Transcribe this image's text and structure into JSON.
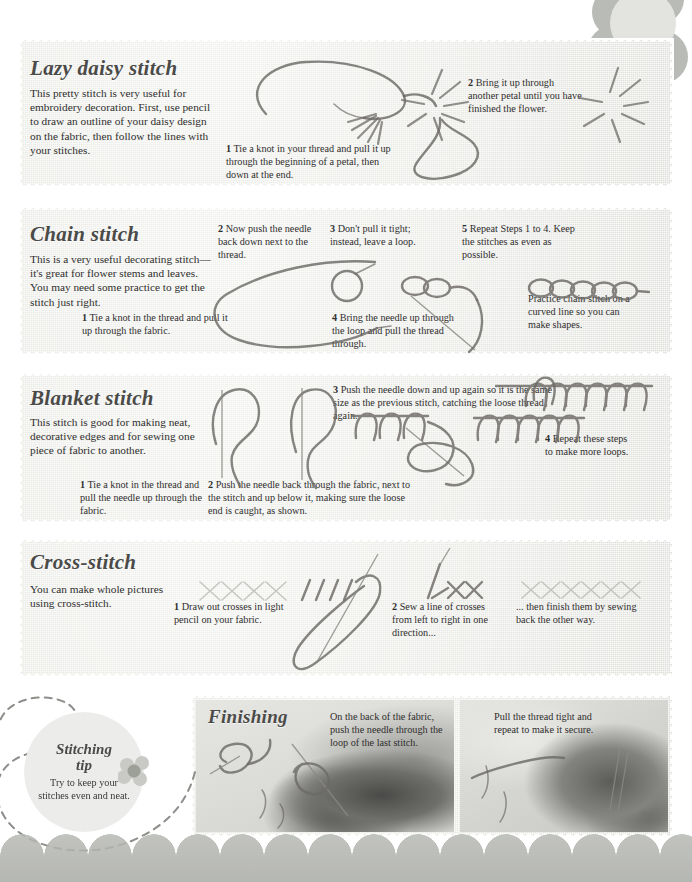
{
  "page": {
    "number": "115",
    "background_color": "#ffffff",
    "panel_color": "#e9e9e6",
    "accent_color": "#b7b9b4"
  },
  "sections": [
    {
      "id": "lazy-daisy",
      "heading": "Lazy daisy stitch",
      "intro": "This pretty stitch is very useful for embroidery decoration. First, use pencil to draw an outline of your daisy design on the fabric, then follow the lines with your stitches.",
      "steps": [
        {
          "number": "1",
          "text": "Tie a knot in your thread and pull it up through the beginning of a petal, then down at the end."
        },
        {
          "number": "2",
          "text": "Bring it up through another petal until you have finished the flower."
        }
      ],
      "notes": []
    },
    {
      "id": "chain-stitch",
      "heading": "Chain stitch",
      "intro": "This is a very useful decorating stitch—it's great for flower stems and leaves. You may need some practice to get the stitch just right.",
      "steps": [
        {
          "number": "1",
          "text": "Tie a knot in the thread and pull it up through the fabric."
        },
        {
          "number": "2",
          "text": "Now push the needle back down next to the thread."
        },
        {
          "number": "3",
          "text": "Don't pull it tight; instead, leave a loop."
        },
        {
          "number": "4",
          "text": "Bring the needle up through the loop and pull the thread through."
        },
        {
          "number": "5",
          "text": "Repeat Steps 1 to 4. Keep the stitches as even as possible."
        }
      ],
      "notes": [
        {
          "text": "Practice chain stitch on a curved line so you can make shapes."
        }
      ]
    },
    {
      "id": "blanket-stitch",
      "heading": "Blanket stitch",
      "intro": "This stitch is good for making neat, decorative edges and for sewing one piece of fabric to another.",
      "steps": [
        {
          "number": "1",
          "text": "Tie a knot in the thread and pull the needle up through the fabric."
        },
        {
          "number": "2",
          "text": "Push the needle back through the fabric, next to the stitch and up below it, making sure the loose end is caught, as shown."
        },
        {
          "number": "3",
          "text": "Push the needle down and up again so it is the same size as the previous stitch, catching the loose thread again."
        },
        {
          "number": "4",
          "text": "Repeat these steps to make more loops."
        }
      ],
      "notes": []
    },
    {
      "id": "cross-stitch",
      "heading": "Cross-stitch",
      "intro": "You can make whole pictures using cross-stitch.",
      "steps": [
        {
          "number": "1",
          "text": "Draw out crosses in light pencil on your fabric."
        },
        {
          "number": "2",
          "text": "Sew a line of crosses from left to right in one direction..."
        }
      ],
      "notes": [
        {
          "text": "... then finish them by sewing back the other way."
        }
      ]
    },
    {
      "id": "finishing",
      "heading": "Finishing",
      "intro": "",
      "steps": [],
      "notes": [
        {
          "text": "On the back of the fabric, push the needle through the loop of the last stitch."
        },
        {
          "text": "Pull the thread tight and repeat to make it secure."
        }
      ]
    }
  ],
  "tip": {
    "title_line1": "Stitching",
    "title_line2": "tip",
    "body": "Try to keep your stitches even and neat."
  },
  "icons": {
    "flower": "flower-icon",
    "page_flower": "page-flower-icon",
    "needle": "needle-icon",
    "thread": "thread-icon"
  }
}
